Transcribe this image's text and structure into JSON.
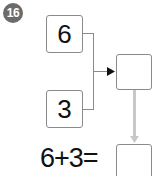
{
  "problem": {
    "number": "16",
    "top_value": "6",
    "bottom_value": "3",
    "result_box": "",
    "equation": "6+3=",
    "answer_box": ""
  },
  "colors": {
    "badge": "#6b6b6b",
    "border": "#8a8a8a",
    "down_arrow": "#c8c8c8"
  }
}
